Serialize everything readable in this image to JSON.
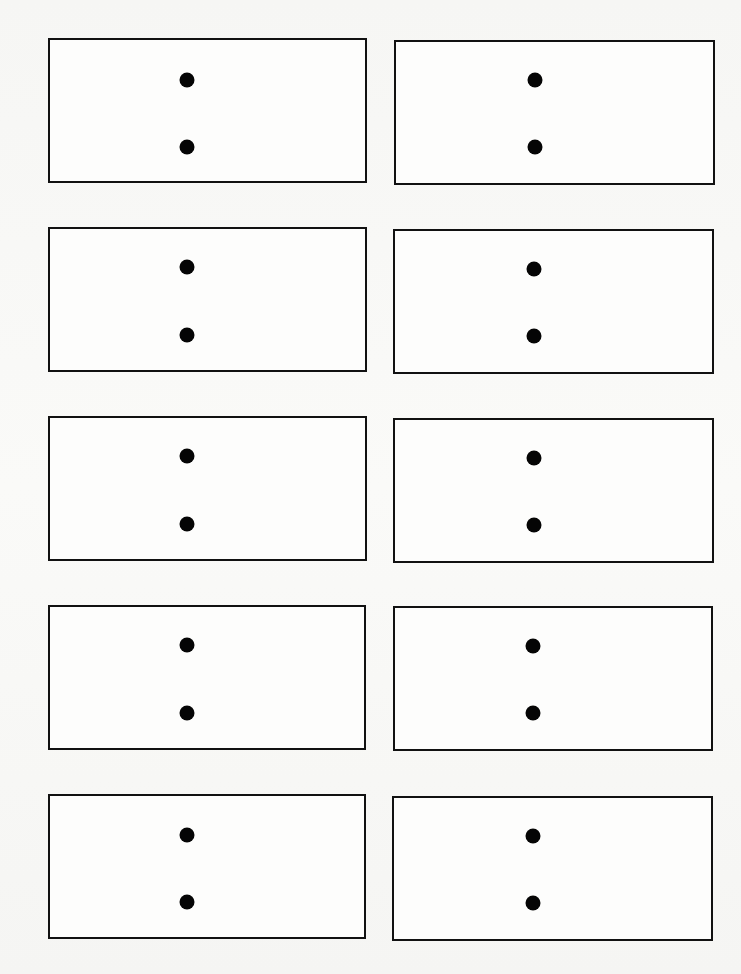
{
  "page": {
    "background": "#f7f7f5",
    "border_color": "#111111",
    "dot_color": "#050505"
  },
  "cards": [
    {
      "row": 1,
      "col": 1,
      "x": 48,
      "y": 38,
      "w": 319,
      "h": 145,
      "dots": [
        {
          "x": 185,
          "y": 78
        },
        {
          "x": 185,
          "y": 145
        }
      ]
    },
    {
      "row": 1,
      "col": 2,
      "x": 394,
      "y": 40,
      "w": 321,
      "h": 145,
      "dots": [
        {
          "x": 533,
          "y": 78
        },
        {
          "x": 533,
          "y": 145
        }
      ]
    },
    {
      "row": 2,
      "col": 1,
      "x": 48,
      "y": 227,
      "w": 319,
      "h": 145,
      "dots": [
        {
          "x": 185,
          "y": 265
        },
        {
          "x": 185,
          "y": 333
        }
      ]
    },
    {
      "row": 2,
      "col": 2,
      "x": 393,
      "y": 229,
      "w": 321,
      "h": 145,
      "dots": [
        {
          "x": 532,
          "y": 267
        },
        {
          "x": 532,
          "y": 334
        }
      ]
    },
    {
      "row": 3,
      "col": 1,
      "x": 48,
      "y": 416,
      "w": 319,
      "h": 145,
      "dots": [
        {
          "x": 185,
          "y": 454
        },
        {
          "x": 185,
          "y": 522
        }
      ]
    },
    {
      "row": 3,
      "col": 2,
      "x": 393,
      "y": 418,
      "w": 321,
      "h": 145,
      "dots": [
        {
          "x": 532,
          "y": 456
        },
        {
          "x": 532,
          "y": 523
        }
      ]
    },
    {
      "row": 4,
      "col": 1,
      "x": 48,
      "y": 605,
      "w": 318,
      "h": 145,
      "dots": [
        {
          "x": 185,
          "y": 643
        },
        {
          "x": 185,
          "y": 711
        }
      ]
    },
    {
      "row": 4,
      "col": 2,
      "x": 393,
      "y": 606,
      "w": 320,
      "h": 145,
      "dots": [
        {
          "x": 531,
          "y": 644
        },
        {
          "x": 531,
          "y": 711
        }
      ]
    },
    {
      "row": 5,
      "col": 1,
      "x": 48,
      "y": 794,
      "w": 318,
      "h": 145,
      "dots": [
        {
          "x": 185,
          "y": 833
        },
        {
          "x": 185,
          "y": 900
        }
      ]
    },
    {
      "row": 5,
      "col": 2,
      "x": 392,
      "y": 796,
      "w": 321,
      "h": 145,
      "dots": [
        {
          "x": 531,
          "y": 834
        },
        {
          "x": 531,
          "y": 901
        }
      ]
    }
  ]
}
